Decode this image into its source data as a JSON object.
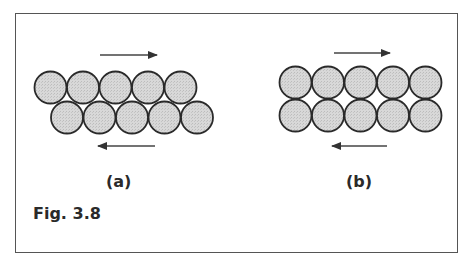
{
  "figure": {
    "caption": "Fig. 3.8",
    "panels": [
      {
        "label": "(a)",
        "arrangement": "offset rows",
        "top_row_count": 5,
        "bottom_row_count": 5,
        "top_arrow": "right",
        "bottom_arrow": "left"
      },
      {
        "label": "(b)",
        "arrangement": "aligned rows",
        "top_row_count": 5,
        "bottom_row_count": 5,
        "top_arrow": "right",
        "bottom_arrow": "left"
      }
    ],
    "colors": {
      "circle_fill": "#d4d4d4",
      "circle_stroke": "#2a2a2a",
      "arrow": "#444444",
      "border": "#555555"
    }
  }
}
